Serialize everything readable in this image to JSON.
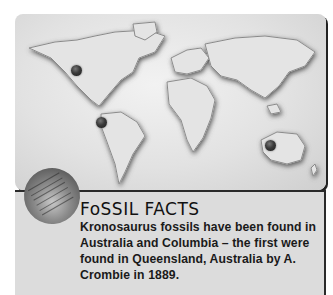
{
  "map": {
    "markers": [
      {
        "name": "north-america-marker",
        "x": 77,
        "y": 70
      },
      {
        "name": "south-america-marker",
        "x": 102,
        "y": 122
      },
      {
        "name": "australia-marker",
        "x": 271,
        "y": 145
      }
    ]
  },
  "facts": {
    "title": "FoSSIL FACTS",
    "body": "Kronosaurus fossils have been found in Australia and Columbia – the first were found in Queensland, Australia by A. Crombie in 1889."
  },
  "colors": {
    "panel_bg": "#dcdcdc",
    "border": "#2a2a2a",
    "marker": "#2e2e2e"
  }
}
